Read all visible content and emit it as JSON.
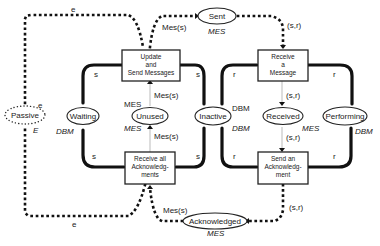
{
  "diagram": {
    "transitions": {
      "update_send": {
        "line1": "Update",
        "line2": "and",
        "line3": "Send Messages"
      },
      "receive_all_ack": {
        "line1": "Receive all",
        "line2": "Acknowledg-",
        "line3": "ments"
      },
      "receive_message": {
        "line1": "Receive",
        "line2": "a",
        "line3": "Message"
      },
      "send_ack": {
        "line1": "Send an",
        "line2": "Acknowledg-",
        "line3": "ment"
      }
    },
    "places": {
      "passive": {
        "label": "Passive",
        "type": "E"
      },
      "waiting": {
        "label": "Waiting",
        "type": "DBM"
      },
      "unused": {
        "label": "Unused",
        "type": "MES"
      },
      "inactive": {
        "label": "Inactive",
        "type": "DBM"
      },
      "received": {
        "label": "Received",
        "type": "MES"
      },
      "performing": {
        "label": "Performing",
        "type": "DBM"
      },
      "sent": {
        "label": "Sent",
        "type": "MES"
      },
      "acknowledged": {
        "label": "Acknowledged",
        "type": "MES"
      }
    },
    "arc_labels": {
      "e_top": "e",
      "e_bottom": "e",
      "e_passive": "e",
      "mes_s_top": "Mes(s)",
      "mes_s_unused_up": "Mes(s)",
      "mes_s_unused_down": "Mes(s)",
      "mes_s_bottom": "Mes(s)",
      "sr_sent": "(s,r)",
      "sr_received_in": "(s,r)",
      "sr_received_out": "(s,r)",
      "sr_ack": "(s,r)",
      "s_waiting_top": "s",
      "s_waiting_bottom": "s",
      "s_inactive_top": "s",
      "s_inactive_bottom": "s",
      "r_inactive_top": "r",
      "r_inactive_bottom": "r",
      "r_performing_top": "r",
      "r_performing_bottom": "r",
      "mes_unused_label": "MES",
      "dbm_inactive_label": "DBM"
    }
  }
}
